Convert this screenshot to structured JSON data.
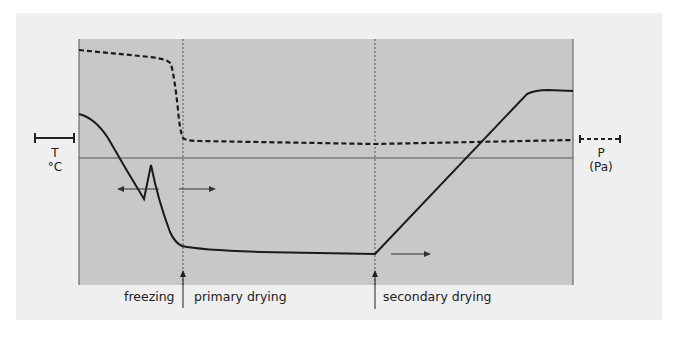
{
  "diagram": {
    "colors": {
      "panel": "#efefef",
      "plot_bg": "#c8c8c8",
      "line": "#1a1a1a",
      "page": "#ffffff"
    },
    "left_axis": {
      "symbol": "T",
      "unit": "°C",
      "scale_bar": "solid"
    },
    "right_axis": {
      "symbol": "P",
      "unit": "(Pa)",
      "scale_bar": "dashed"
    },
    "phases": [
      {
        "label": "freezing"
      },
      {
        "label": "primary drying"
      },
      {
        "label": "secondary drying"
      }
    ],
    "phase_boundaries": [
      "freezing / primary drying",
      "primary drying / secondary drying"
    ],
    "arrows": [
      {
        "direction": "left",
        "meaning": "freezing"
      },
      {
        "direction": "right",
        "meaning": "primary drying"
      },
      {
        "direction": "right",
        "meaning": "secondary drying"
      }
    ],
    "series": [
      {
        "name": "Temperature (T)",
        "style": "solid",
        "shape": "start above 0, cool below 0, supercooling dip then nucleation spike, fall to low plateau during primary drying, linear ramp up in secondary drying, plateau above 0"
      },
      {
        "name": "Pressure (P)",
        "style": "dashed",
        "shape": "high during freezing, sharp drop at start of primary drying, low constant vacuum afterwards"
      }
    ]
  }
}
